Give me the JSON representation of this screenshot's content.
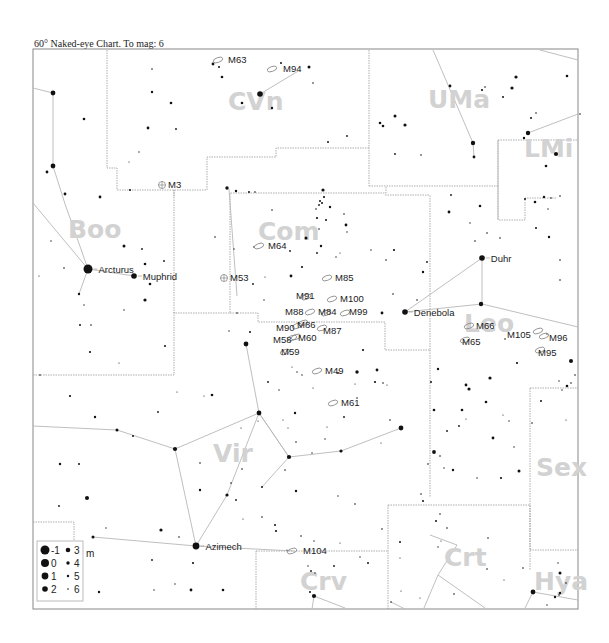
{
  "title": "60° Naked-eye Chart. To mag: 6",
  "colors": {
    "star": "#111111",
    "boundary": "#9a9a9a",
    "figure": "#b8b8b8",
    "constellation_label": "#d2d2d2",
    "frame": "#888888"
  },
  "constellations": [
    {
      "abbr": "CVn",
      "x": 228,
      "y": 110
    },
    {
      "abbr": "UMa",
      "x": 428,
      "y": 108
    },
    {
      "abbr": "LMi",
      "x": 524,
      "y": 157
    },
    {
      "abbr": "Boo",
      "x": 68,
      "y": 238
    },
    {
      "abbr": "Com",
      "x": 258,
      "y": 240
    },
    {
      "abbr": "Leo",
      "x": 464,
      "y": 332
    },
    {
      "abbr": "Vir",
      "x": 213,
      "y": 462
    },
    {
      "abbr": "Sex",
      "x": 536,
      "y": 476
    },
    {
      "abbr": "Crv",
      "x": 300,
      "y": 590
    },
    {
      "abbr": "Crt",
      "x": 444,
      "y": 566
    },
    {
      "abbr": "Hya",
      "x": 534,
      "y": 590
    }
  ],
  "named_stars": [
    {
      "name": "Arcturus",
      "x": 88,
      "y": 269,
      "mag": -1
    },
    {
      "name": "Muphrid",
      "x": 134,
      "y": 276,
      "mag": 2
    },
    {
      "name": "Denebola",
      "x": 405,
      "y": 312,
      "mag": 2
    },
    {
      "name": "Duhr",
      "x": 482,
      "y": 258,
      "mag": 2
    },
    {
      "name": "Azimech",
      "x": 196,
      "y": 546,
      "mag": 1
    }
  ],
  "deep_sky_objects": [
    {
      "id": "M63",
      "x": 218,
      "y": 60,
      "type": "galaxy",
      "lx": 228,
      "ly": 63
    },
    {
      "id": "M94",
      "x": 272,
      "y": 69,
      "type": "galaxy",
      "lx": 283,
      "ly": 72
    },
    {
      "id": "M3",
      "x": 162,
      "y": 185,
      "type": "cluster",
      "lx": 168,
      "ly": 188
    },
    {
      "id": "M64",
      "x": 259,
      "y": 246,
      "type": "galaxy",
      "lx": 268,
      "ly": 249
    },
    {
      "id": "M53",
      "x": 224,
      "y": 278,
      "type": "cluster",
      "lx": 230,
      "ly": 281
    },
    {
      "id": "M85",
      "x": 327,
      "y": 278,
      "type": "galaxy",
      "lx": 335,
      "ly": 281
    },
    {
      "id": "M91",
      "x": 306,
      "y": 297,
      "type": "galaxy",
      "lx": 296,
      "ly": 299
    },
    {
      "id": "M100",
      "x": 332,
      "y": 299,
      "type": "galaxy",
      "lx": 340,
      "ly": 302
    },
    {
      "id": "M88",
      "x": 310,
      "y": 312,
      "type": "galaxy",
      "lx": 285,
      "ly": 315
    },
    {
      "id": "M84",
      "x": 326,
      "y": 313,
      "type": "galaxy",
      "lx": 318,
      "ly": 315
    },
    {
      "id": "M99",
      "x": 345,
      "y": 313,
      "type": "galaxy",
      "lx": 349,
      "ly": 315
    },
    {
      "id": "M90",
      "x": 297,
      "y": 326,
      "type": "galaxy",
      "lx": 276,
      "ly": 331
    },
    {
      "id": "M86",
      "x": 303,
      "y": 323,
      "type": "galaxy",
      "lx": 297,
      "ly": 328
    },
    {
      "id": "M87",
      "x": 322,
      "y": 328,
      "type": "galaxy",
      "lx": 323,
      "ly": 334
    },
    {
      "id": "M58",
      "x": 292,
      "y": 338,
      "type": "galaxy",
      "lx": 273,
      "ly": 343
    },
    {
      "id": "M60",
      "x": 296,
      "y": 337,
      "type": "galaxy",
      "lx": 298,
      "ly": 341
    },
    {
      "id": "M59",
      "x": 285,
      "y": 352,
      "type": "galaxy",
      "lx": 281,
      "ly": 355
    },
    {
      "id": "M49",
      "x": 317,
      "y": 371,
      "type": "galaxy",
      "lx": 325,
      "ly": 374
    },
    {
      "id": "M61",
      "x": 333,
      "y": 403,
      "type": "galaxy",
      "lx": 341,
      "ly": 406
    },
    {
      "id": "M66",
      "x": 469,
      "y": 326,
      "type": "galaxy",
      "lx": 476,
      "ly": 329
    },
    {
      "id": "M65",
      "x": 465,
      "y": 340,
      "type": "galaxy",
      "lx": 462,
      "ly": 345
    },
    {
      "id": "M105",
      "x": 538,
      "y": 331,
      "type": "galaxy",
      "lx": 507,
      "ly": 338
    },
    {
      "id": "M96",
      "x": 544,
      "y": 336,
      "type": "galaxy",
      "lx": 549,
      "ly": 341
    },
    {
      "id": "M95",
      "x": 540,
      "y": 350,
      "type": "galaxy",
      "lx": 538,
      "ly": 356
    },
    {
      "id": "M104",
      "x": 292,
      "y": 551,
      "type": "galaxy",
      "lx": 303,
      "ly": 554
    }
  ],
  "legend": {
    "unit": "m",
    "entries": [
      {
        "mag": "-1",
        "r": 4.5
      },
      {
        "mag": "0",
        "r": 4
      },
      {
        "mag": "1",
        "r": 3.4
      },
      {
        "mag": "2",
        "r": 2.8
      },
      {
        "mag": "3",
        "r": 2.3
      },
      {
        "mag": "4",
        "r": 1.7
      },
      {
        "mag": "5",
        "r": 1.2
      },
      {
        "mag": "6",
        "r": 0.8
      }
    ]
  }
}
